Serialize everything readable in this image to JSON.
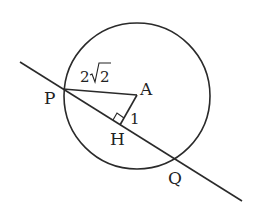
{
  "diagram": {
    "type": "geometry",
    "circle": {
      "center_label": "A",
      "cx": 137,
      "cy": 96,
      "r": 73
    },
    "points": {
      "P": {
        "label": "P",
        "x": 63,
        "y": 89
      },
      "A": {
        "label": "A",
        "x": 137,
        "y": 95
      },
      "H": {
        "label": "H",
        "x": 120,
        "y": 125
      },
      "Q": {
        "label": "Q",
        "x": 175,
        "y": 160
      }
    },
    "segment_labels": {
      "PA": "2√2",
      "PA_coef": "2",
      "PA_radicand": "2",
      "AH": "1"
    },
    "right_angle_at": "H",
    "stroke_color": "#2a2a2a"
  }
}
